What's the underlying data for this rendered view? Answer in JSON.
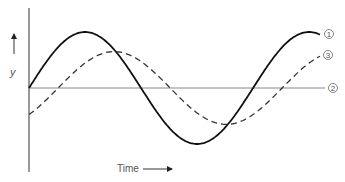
{
  "chart_data": {
    "type": "line",
    "title": "",
    "xlabel": "Time",
    "ylabel": "y",
    "grid": false,
    "legend": "right-inline",
    "x_range": [
      0,
      1
    ],
    "y_range": [
      -1,
      1
    ],
    "series": [
      {
        "name": "1",
        "label": "①",
        "style": "solid",
        "color": "#111111",
        "description": "sine wave starting at zero",
        "amplitude": 1.0,
        "phase_cycles": 0.0,
        "period": 0.77
      },
      {
        "name": "2",
        "label": "②",
        "style": "thin-solid",
        "color": "#888888",
        "description": "zero baseline",
        "constant": 0
      },
      {
        "name": "3",
        "label": "③",
        "style": "dashed",
        "color": "#333333",
        "description": "sine wave lagging curve 1",
        "amplitude": 0.65,
        "phase_cycles": -0.13,
        "period": 0.77
      }
    ]
  },
  "labels": {
    "y_axis": "y",
    "time": "Time",
    "c1": "1",
    "c2": "2",
    "c3": "3"
  }
}
